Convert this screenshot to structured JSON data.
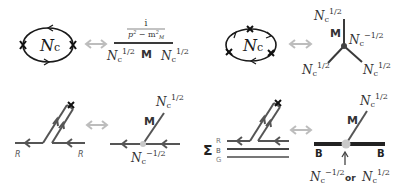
{
  "colors": {
    "ink": "#1a1a1a",
    "line": "#3a3a3a",
    "gray_line": "#666666",
    "arrow_gray": "#bdbdbd",
    "vertex_light": "#c8c8c8",
    "label_gray": "#777777"
  },
  "panels": {
    "top_left": {
      "loop_label": "Nc",
      "loop_label_main": "N",
      "loop_label_sub": "c",
      "propagator_numerator": "i",
      "propagator_denominator": "p² − m²",
      "propagator_den_p": "p",
      "propagator_den_minus": " − m",
      "propagator_den_sub": "M",
      "meson_label": "M",
      "left_factor_main": "N",
      "left_factor_sub": "c",
      "left_factor_exp": "1/2",
      "right_factor_main": "N",
      "right_factor_sub": "c",
      "right_factor_exp": "1/2"
    },
    "top_right": {
      "loop_label_main": "N",
      "loop_label_sub": "c",
      "meson_label": "M",
      "top_factor_main": "N",
      "top_factor_sub": "c",
      "top_factor_exp": "1/2",
      "vertex_factor_main": "N",
      "vertex_factor_sub": "c",
      "vertex_factor_exp": "−1/2",
      "left_factor_main": "N",
      "left_factor_sub": "c",
      "left_factor_exp": "1/2",
      "right_factor_main": "N",
      "right_factor_sub": "c",
      "right_factor_exp": "1/2"
    },
    "bottom_left": {
      "left_color_label": "R",
      "right_color_label": "R",
      "meson_label": "M",
      "top_factor_main": "N",
      "top_factor_sub": "c",
      "top_factor_exp": "1/2",
      "vertex_factor_main": "N",
      "vertex_factor_sub": "c",
      "vertex_factor_exp": "−1/2"
    },
    "bottom_right": {
      "sum_symbol": "Σ",
      "color_labels": [
        "R",
        "B",
        "G"
      ],
      "meson_label": "M",
      "top_factor_main": "N",
      "top_factor_sub": "c",
      "top_factor_exp": "1/2",
      "baryon_left_label": "B",
      "baryon_right_label": "B",
      "option1_main": "N",
      "option1_sub": "c",
      "option1_exp": "−1/2",
      "or_label": "or",
      "option2_main": "N",
      "option2_sub": "c",
      "option2_exp": "1/2"
    }
  },
  "equivalence_arrow": "⟷"
}
